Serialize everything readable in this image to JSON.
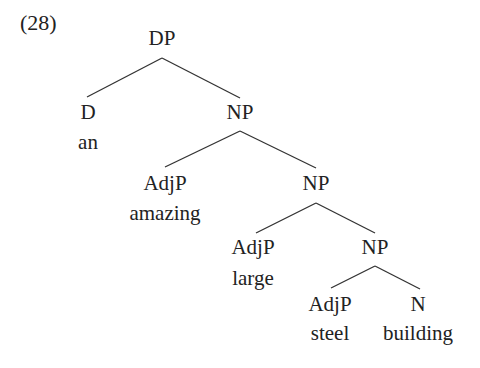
{
  "example_number": "(28)",
  "tree": {
    "root": {
      "label": "DP",
      "x": 162,
      "y": 38
    },
    "nodes": [
      {
        "id": "d",
        "label": "D",
        "x": 88,
        "y": 112
      },
      {
        "id": "d_word",
        "label": "an",
        "x": 88,
        "y": 142
      },
      {
        "id": "np1",
        "label": "NP",
        "x": 240,
        "y": 112
      },
      {
        "id": "adjp1",
        "label": "AdjP",
        "x": 165,
        "y": 183
      },
      {
        "id": "adjp1_word",
        "label": "amazing",
        "x": 165,
        "y": 213
      },
      {
        "id": "np2",
        "label": "NP",
        "x": 316,
        "y": 183
      },
      {
        "id": "adjp2",
        "label": "AdjP",
        "x": 253,
        "y": 247
      },
      {
        "id": "adjp2_word",
        "label": "large",
        "x": 253,
        "y": 278
      },
      {
        "id": "np3",
        "label": "NP",
        "x": 375,
        "y": 247
      },
      {
        "id": "adjp3",
        "label": "AdjP",
        "x": 330,
        "y": 304
      },
      {
        "id": "adjp3_word",
        "label": "steel",
        "x": 330,
        "y": 333
      },
      {
        "id": "n",
        "label": "N",
        "x": 418,
        "y": 304
      },
      {
        "id": "n_word",
        "label": "building",
        "x": 418,
        "y": 333
      }
    ],
    "edges": [
      {
        "x1": 162,
        "y1": 58,
        "x2": 87,
        "y2": 97
      },
      {
        "x1": 162,
        "y1": 58,
        "x2": 240,
        "y2": 98
      },
      {
        "x1": 240,
        "y1": 131,
        "x2": 165,
        "y2": 167
      },
      {
        "x1": 240,
        "y1": 131,
        "x2": 316,
        "y2": 168
      },
      {
        "x1": 316,
        "y1": 203,
        "x2": 256,
        "y2": 233
      },
      {
        "x1": 316,
        "y1": 203,
        "x2": 375,
        "y2": 233
      },
      {
        "x1": 375,
        "y1": 266,
        "x2": 331,
        "y2": 288
      },
      {
        "x1": 375,
        "y1": 266,
        "x2": 420,
        "y2": 289
      }
    ]
  }
}
